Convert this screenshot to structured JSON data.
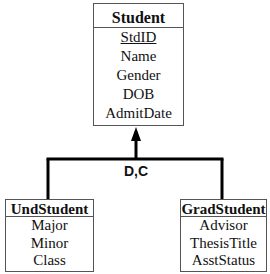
{
  "diagram": {
    "type": "EER specialization",
    "superclass": {
      "name": "Student",
      "attributes": [
        {
          "name": "StdID",
          "key": true
        },
        {
          "name": "Name",
          "key": false
        },
        {
          "name": "Gender",
          "key": false
        },
        {
          "name": "DOB",
          "key": false
        },
        {
          "name": "AdmitDate",
          "key": false
        }
      ]
    },
    "constraint_label": "D,C",
    "subclasses": [
      {
        "name": "UndStudent",
        "attributes": [
          "Major",
          "Minor",
          "Class"
        ]
      },
      {
        "name": "GradStudent",
        "attributes": [
          "Advisor",
          "ThesisTitle",
          "AsstStatus"
        ]
      }
    ]
  }
}
